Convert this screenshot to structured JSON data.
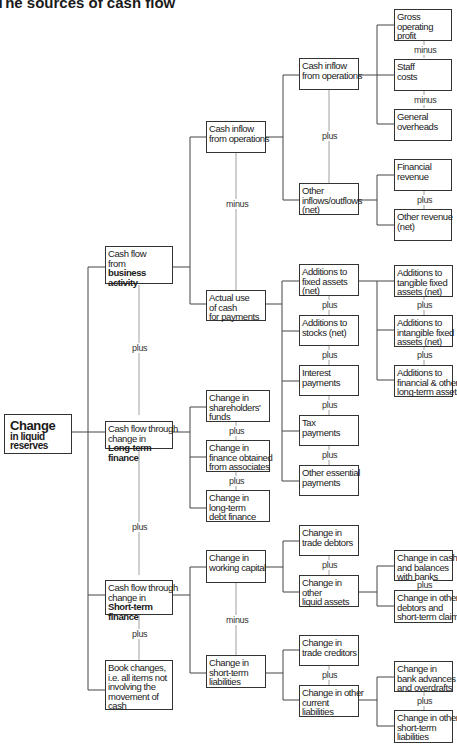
{
  "title": "The sources of cash flow",
  "root": {
    "line1": "Change",
    "line2": "in liquid",
    "line3": "reserves"
  },
  "level1": {
    "business": {
      "l1": "Cash flow",
      "l2": "from",
      "l3": "business",
      "l4": "activity"
    },
    "longterm": {
      "l1": "Cash flow through",
      "l2": "change in",
      "l3": "Long-term",
      "l4": "finance"
    },
    "shortterm": {
      "l1": "Cash flow through",
      "l2": "change in",
      "l3": "Short-term",
      "l4": "finance"
    },
    "book": {
      "l1": "Book changes,",
      "l2": "i.e. all items not",
      "l3": "involving the",
      "l4": "movement of",
      "l5": "cash"
    }
  },
  "level2": {
    "cash_inflow": {
      "l1": "Cash inflow",
      "l2": "from operations"
    },
    "actual_use": {
      "l1": "Actual use",
      "l2": "of cash",
      "l3": "for payments"
    },
    "shareholders": {
      "l1": "Change in",
      "l2": "shareholders'",
      "l3": "funds"
    },
    "associates": {
      "l1": "Change in",
      "l2": "finance obtained",
      "l3": "from associates"
    },
    "longterm_debt": {
      "l1": "Change in",
      "l2": "long-term",
      "l3": "debt finance"
    },
    "working_capital": {
      "l1": "Change in",
      "l2": "working capital"
    },
    "st_liabilities": {
      "l1": "Change in",
      "l2": "short-term",
      "l3": "liabilities"
    }
  },
  "level3": {
    "cash_inflow_ops": {
      "l1": "Cash inflow",
      "l2": "from operations"
    },
    "other_inflows": {
      "l1": "Other",
      "l2": "inflows/outflows",
      "l3": "(net)"
    },
    "fixed_assets": {
      "l1": "Additions to",
      "l2": "fixed assets",
      "l3": "(net)"
    },
    "stocks": {
      "l1": "Additions to",
      "l2": "stocks (net)"
    },
    "interest": {
      "l1": "Interest",
      "l2": "payments"
    },
    "tax": {
      "l1": "Tax",
      "l2": "payments"
    },
    "other_essential": {
      "l1": "Other essential",
      "l2": "payments"
    },
    "trade_debtors": {
      "l1": "Change in",
      "l2": "trade debtors"
    },
    "other_liquid": {
      "l1": "Change in",
      "l2": "other",
      "l3": "liquid assets"
    },
    "trade_creditors": {
      "l1": "Change in",
      "l2": "trade creditors"
    },
    "other_current": {
      "l1": "Change in other",
      "l2": "current",
      "l3": "liabilities"
    }
  },
  "level4": {
    "gross_profit": {
      "l1": "Gross",
      "l2": "operating",
      "l3": "profit"
    },
    "staff_costs": {
      "l1": "Staff",
      "l2": "costs"
    },
    "overheads": {
      "l1": "General",
      "l2": "overheads"
    },
    "financial_revenue": {
      "l1": "Financial",
      "l2": "revenue"
    },
    "other_revenue": {
      "l1": "Other revenue",
      "l2": "(net)"
    },
    "tangible": {
      "l1": "Additions to",
      "l2": "tangible fixed",
      "l3": "assets (net)"
    },
    "intangible": {
      "l1": "Additions to",
      "l2": "intangible fixed",
      "l3": "assets (net)"
    },
    "financial_lt": {
      "l1": "Additions to",
      "l2": "financial & other",
      "l3": "long-term assets"
    },
    "cash_banks": {
      "l1": "Change in cash",
      "l2": "and balances",
      "l3": "with banks"
    },
    "other_debtors": {
      "l1": "Change in other",
      "l2": "debtors and",
      "l3": "short-term claims"
    },
    "bank_advances": {
      "l1": "Change in",
      "l2": "bank advances",
      "l3": "and overdrafts"
    },
    "other_st_liab": {
      "l1": "Change in other",
      "l2": "short-term",
      "l3": "liabilities"
    }
  },
  "operators": {
    "plus": "plus",
    "minus": "minus"
  }
}
